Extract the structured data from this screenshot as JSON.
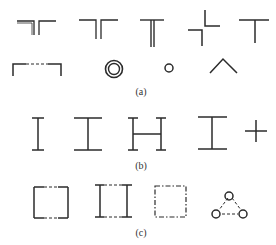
{
  "figure": {
    "stroke_color": "#2b2b2b",
    "background": "#ffffff",
    "sections": [
      {
        "id": "a",
        "caption": "(a)",
        "rows": [
          [
            "double-line-inverted-t-split",
            "double-line-t",
            "thick-stem-t",
            "offset-cross",
            "simple-t"
          ],
          [
            "bracket-dashed-top",
            "double-circle",
            "small-circle",
            "caret"
          ]
        ]
      },
      {
        "id": "b",
        "caption": "(b)",
        "rows": [
          [
            "i-beam-narrow",
            "i-beam-wide",
            "h-shape",
            "i-beam-wide",
            "plus"
          ]
        ]
      },
      {
        "id": "c",
        "caption": "(c)",
        "rows": [
          [
            "square-dashed-top-bottom",
            "double-i-beam-dashed",
            "dashed-square",
            "triangle-of-circles-dashed"
          ]
        ]
      }
    ]
  }
}
